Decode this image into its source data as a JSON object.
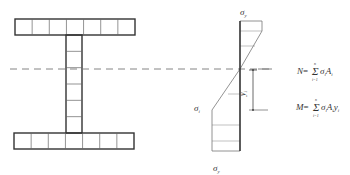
{
  "diagram": {
    "section": {
      "top_flange_fibers": 7,
      "web_fibers": 6,
      "bottom_flange_fibers": 7
    },
    "stress": {
      "top_label": "σ",
      "top_sub": "y",
      "bottom_label": "σ",
      "bottom_sub": "y",
      "left_label": "σ",
      "left_sub": "i",
      "dim_label": "y",
      "dim_sub": "i"
    },
    "formulas": [
      {
        "lhs": "N",
        "eq": "=",
        "sum": "Σ",
        "upper": "n",
        "lower": "i=1",
        "body": "σ",
        "body_sub": "i",
        "tail": "A",
        "tail_sub": "i",
        "tail2": "",
        "tail2_sub": ""
      },
      {
        "lhs": "M",
        "eq": "=",
        "sum": "Σ",
        "upper": "n",
        "lower": "i=1",
        "body": "σ",
        "body_sub": "i",
        "tail": "A",
        "tail_sub": "i",
        "tail2": "y",
        "tail2_sub": "i"
      }
    ]
  }
}
